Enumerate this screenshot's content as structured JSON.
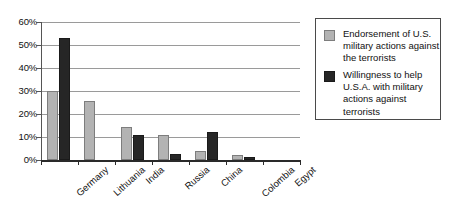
{
  "chart_data": {
    "type": "bar",
    "title": "",
    "subtitle": "",
    "xlabel": "",
    "ylabel": "",
    "ylim": [
      0,
      60
    ],
    "ytick_step": 10,
    "ytick_labels": [
      "0%",
      "10%",
      "20%",
      "30%",
      "40%",
      "50%",
      "60%"
    ],
    "ytick_values": [
      0,
      10,
      20,
      30,
      40,
      50,
      60
    ],
    "grid": true,
    "grid_axis": "y",
    "legend_position": "right",
    "categories": [
      "Germany",
      "Lithuania",
      "India",
      "Russia",
      "China",
      "Colombia",
      "Egypt"
    ],
    "series": [
      {
        "name": "Endorsement of U.S. military actions against the terrorists",
        "color": "#b3b3b3",
        "values": [
          30,
          25.5,
          14.5,
          11,
          4,
          2,
          0
        ]
      },
      {
        "name": "Willingness to help U.S.A. with military actions against terrorists",
        "color": "#262626",
        "values": [
          53,
          0,
          11,
          2.5,
          12,
          1.5,
          0
        ]
      }
    ]
  },
  "legend": {
    "entries": [
      {
        "label": "Endorsement of U.S. military actions against the terrorists",
        "swatch": "light"
      },
      {
        "label": "Willingness to help U.S.A. with military actions against terrorists",
        "swatch": "dark"
      }
    ]
  },
  "colors": {
    "series_light": "#b3b3b3",
    "series_dark": "#262626",
    "gridline": "#9a9a9a",
    "axis": "#2a2a2a",
    "text": "#111111",
    "background": "#ffffff"
  }
}
